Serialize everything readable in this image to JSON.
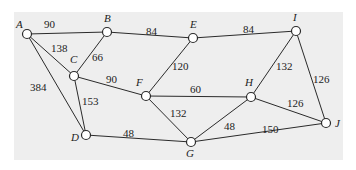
{
  "diagram": {
    "type": "weighted-undirected-graph",
    "background": "#eeeeee",
    "nodes": [
      {
        "id": "A",
        "label": "A",
        "x": 27,
        "y": 34,
        "lx": 16,
        "ly": 28
      },
      {
        "id": "B",
        "label": "B",
        "x": 107,
        "y": 32,
        "lx": 104,
        "ly": 22
      },
      {
        "id": "C",
        "label": "C",
        "x": 74,
        "y": 76,
        "lx": 70,
        "ly": 63
      },
      {
        "id": "D",
        "label": "D",
        "x": 86,
        "y": 135,
        "lx": 71,
        "ly": 141
      },
      {
        "id": "E",
        "label": "E",
        "x": 193,
        "y": 38,
        "lx": 190,
        "ly": 28
      },
      {
        "id": "F",
        "label": "F",
        "x": 146,
        "y": 96,
        "lx": 136,
        "ly": 86
      },
      {
        "id": "G",
        "label": "G",
        "x": 191,
        "y": 142,
        "lx": 186,
        "ly": 157
      },
      {
        "id": "H",
        "label": "H",
        "x": 251,
        "y": 97,
        "lx": 245,
        "ly": 86
      },
      {
        "id": "I",
        "label": "I",
        "x": 296,
        "y": 31,
        "lx": 293,
        "ly": 21
      },
      {
        "id": "J",
        "label": "J",
        "x": 326,
        "y": 123,
        "lx": 335,
        "ly": 127
      }
    ],
    "edges": [
      {
        "from": "A",
        "to": "B",
        "weight": "90",
        "lx": 44,
        "ly": 28
      },
      {
        "from": "A",
        "to": "C",
        "weight": "138",
        "lx": 51,
        "ly": 52
      },
      {
        "from": "A",
        "to": "D",
        "weight": "384",
        "lx": 30,
        "ly": 91
      },
      {
        "from": "B",
        "to": "C",
        "weight": "66",
        "lx": 92,
        "ly": 61
      },
      {
        "from": "B",
        "to": "E",
        "weight": "84",
        "lx": 146,
        "ly": 35
      },
      {
        "from": "C",
        "to": "F",
        "weight": "90",
        "lx": 106,
        "ly": 83
      },
      {
        "from": "C",
        "to": "D",
        "weight": "153",
        "lx": 82,
        "ly": 105
      },
      {
        "from": "E",
        "to": "F",
        "weight": "120",
        "lx": 172,
        "ly": 70
      },
      {
        "from": "E",
        "to": "I",
        "weight": "84",
        "lx": 243,
        "ly": 33
      },
      {
        "from": "F",
        "to": "H",
        "weight": "60",
        "lx": 190,
        "ly": 93
      },
      {
        "from": "F",
        "to": "G",
        "weight": "132",
        "lx": 170,
        "ly": 117
      },
      {
        "from": "D",
        "to": "G",
        "weight": "48",
        "lx": 123,
        "ly": 137
      },
      {
        "from": "I",
        "to": "H",
        "weight": "132",
        "lx": 276,
        "ly": 70
      },
      {
        "from": "I",
        "to": "J",
        "weight": "126",
        "lx": 313,
        "ly": 83
      },
      {
        "from": "H",
        "to": "J",
        "weight": "126",
        "lx": 287,
        "ly": 107
      },
      {
        "from": "H",
        "to": "G",
        "weight": "48",
        "lx": 224,
        "ly": 130
      },
      {
        "from": "G",
        "to": "J",
        "weight": "150",
        "lx": 262,
        "ly": 133
      }
    ]
  }
}
